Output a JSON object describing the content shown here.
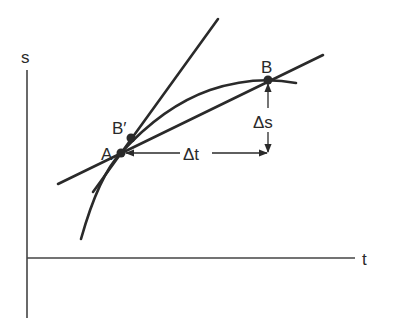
{
  "diagram": {
    "axes": {
      "y_label": "s",
      "x_label": "t"
    },
    "points": {
      "A": "A",
      "B": "B",
      "B_prime": "B′"
    },
    "annotations": {
      "delta_t": "Δt",
      "delta_s": "Δs"
    },
    "elements": [
      "curve s(t)",
      "secant line AB",
      "tangent line at A",
      "point B' on curve near A"
    ],
    "colors": {
      "ink": "#2a2a2a",
      "background": "#ffffff"
    }
  }
}
